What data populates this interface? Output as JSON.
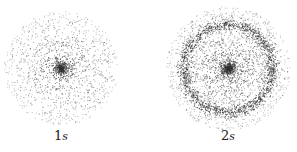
{
  "figure": {
    "panels": [
      {
        "id": "1s",
        "label_num": "1",
        "label_orb": "s",
        "center": [
          61,
          68
        ],
        "cloud_radius": 57,
        "core_radius": 8,
        "ring_radius": null,
        "dots": 1400
      },
      {
        "id": "2s",
        "label_num": "2",
        "label_orb": "s",
        "center": [
          228,
          68
        ],
        "cloud_radius": 62,
        "core_radius": 7,
        "ring_radius": 44,
        "dots": 2200
      }
    ],
    "dot_color": "#333333",
    "background": "#ffffff"
  }
}
